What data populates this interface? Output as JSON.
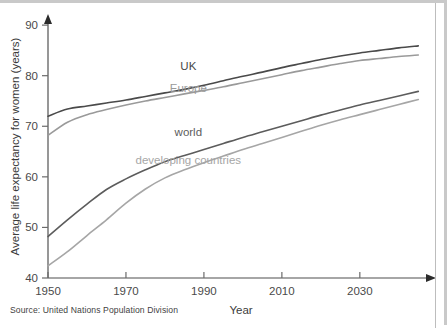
{
  "figure": {
    "source_note": "Source:  United Nations Population Division",
    "frame_color": "#c9c9c9"
  },
  "chart_data": {
    "type": "line",
    "title": "",
    "xlabel": "Year",
    "ylabel": "Average life expectancy for women (years)",
    "xlim": [
      1950,
      2048
    ],
    "ylim": [
      40,
      92
    ],
    "xticks": [
      1950,
      1970,
      1990,
      2010,
      2030
    ],
    "xtick_labels": [
      "1950",
      "1970",
      "1990",
      "2010",
      "2030"
    ],
    "yticks": [
      40,
      50,
      60,
      70,
      80,
      90
    ],
    "ytick_labels": [
      "40",
      "50",
      "60",
      "70",
      "80",
      "90"
    ],
    "grid": false,
    "legend_position": "inline-labels",
    "series": [
      {
        "name": "UK",
        "color": "#4a4a4a",
        "label_x": 1986,
        "label_y": 81.2,
        "x": [
          1950,
          1955,
          1960,
          1965,
          1970,
          1975,
          1980,
          1985,
          1990,
          1995,
          2000,
          2005,
          2010,
          2015,
          2020,
          2025,
          2030,
          2035,
          2040,
          2045
        ],
        "values": [
          72.0,
          73.4,
          74.0,
          74.6,
          75.2,
          75.9,
          76.6,
          77.3,
          78.1,
          79.0,
          79.9,
          80.7,
          81.6,
          82.4,
          83.2,
          83.9,
          84.5,
          85.0,
          85.5,
          85.9
        ]
      },
      {
        "name": "Europe",
        "color": "#9a9a9a",
        "label_x": 1986,
        "label_y": 76.8,
        "x": [
          1950,
          1955,
          1960,
          1965,
          1970,
          1975,
          1980,
          1985,
          1990,
          1995,
          2000,
          2005,
          2010,
          2015,
          2020,
          2025,
          2030,
          2035,
          2040,
          2045
        ],
        "values": [
          68.2,
          70.8,
          72.3,
          73.3,
          74.2,
          75.0,
          75.7,
          76.4,
          77.1,
          77.8,
          78.6,
          79.4,
          80.2,
          81.0,
          81.7,
          82.4,
          83.0,
          83.4,
          83.8,
          84.1
        ]
      },
      {
        "name": "world",
        "color": "#5c5c5c",
        "label_x": 1986,
        "label_y": 68.0,
        "x": [
          1950,
          1955,
          1960,
          1965,
          1970,
          1975,
          1980,
          1985,
          1990,
          1995,
          2000,
          2005,
          2010,
          2015,
          2020,
          2025,
          2030,
          2035,
          2040,
          2045
        ],
        "values": [
          48.2,
          51.5,
          54.6,
          57.5,
          59.6,
          61.4,
          63.0,
          64.2,
          65.4,
          66.6,
          67.8,
          68.9,
          70.0,
          71.1,
          72.2,
          73.2,
          74.2,
          75.1,
          76.0,
          76.9
        ]
      },
      {
        "name": "developing countries",
        "color": "#a6a6a6",
        "label_x": 1986,
        "label_y": 62.5,
        "x": [
          1950,
          1955,
          1960,
          1965,
          1970,
          1975,
          1980,
          1985,
          1990,
          1995,
          2000,
          2005,
          2010,
          2015,
          2020,
          2025,
          2030,
          2035,
          2040,
          2045
        ],
        "values": [
          42.4,
          45.2,
          48.4,
          51.5,
          54.8,
          57.6,
          59.8,
          61.4,
          62.8,
          64.1,
          65.4,
          66.6,
          67.8,
          69.0,
          70.2,
          71.3,
          72.3,
          73.3,
          74.3,
          75.3
        ]
      }
    ]
  }
}
